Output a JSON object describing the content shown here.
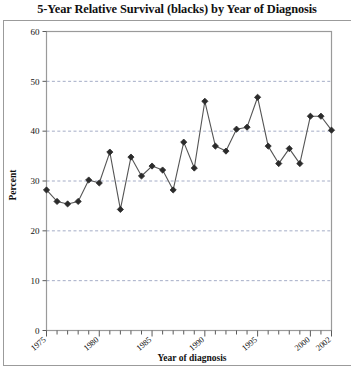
{
  "figure": {
    "title": "5-Year Relative Survival (blacks) by Year of Diagnosis",
    "percent_axis_label": "Percent",
    "year_axis_label": "Year of diagnosis"
  },
  "chart_data": {
    "type": "line",
    "title": "5-Year Relative Survival (blacks) by Year of Diagnosis",
    "xlabel": "Year of diagnosis",
    "ylabel": "Percent",
    "xlim": [
      1975,
      2002
    ],
    "ylim": [
      0,
      60
    ],
    "grid": true,
    "grid_axis": "y",
    "grid_style": "dashed",
    "legend": "none",
    "marker": "diamond",
    "line_color": "#4d4d4d",
    "marker_color": "#2b2b2b",
    "x": [
      1975,
      1976,
      1977,
      1978,
      1979,
      1980,
      1981,
      1982,
      1983,
      1984,
      1985,
      1986,
      1987,
      1988,
      1989,
      1990,
      1991,
      1992,
      1993,
      1994,
      1995,
      1996,
      1997,
      1998,
      1999,
      2000,
      2001,
      2002
    ],
    "values": [
      28.2,
      25.9,
      25.4,
      25.9,
      30.2,
      29.6,
      35.8,
      24.3,
      34.8,
      31.0,
      33.0,
      32.2,
      28.2,
      37.8,
      32.6,
      46.0,
      37.0,
      36.0,
      40.4,
      40.8,
      46.8,
      37.0,
      33.5,
      36.5,
      33.5,
      43.0,
      43.0,
      40.2
    ],
    "ytick_labels": [
      "0",
      "10",
      "20",
      "30",
      "40",
      "50",
      "60"
    ],
    "ytick_values": [
      0,
      10,
      20,
      30,
      40,
      50,
      60
    ],
    "xtick_labels": [
      "1975",
      "1980",
      "1985",
      "1990",
      "1995",
      "2000",
      "2002"
    ],
    "xtick_values": [
      1975,
      1980,
      1985,
      1990,
      1995,
      2000,
      2002
    ],
    "xminor_tick_interval": 1
  }
}
